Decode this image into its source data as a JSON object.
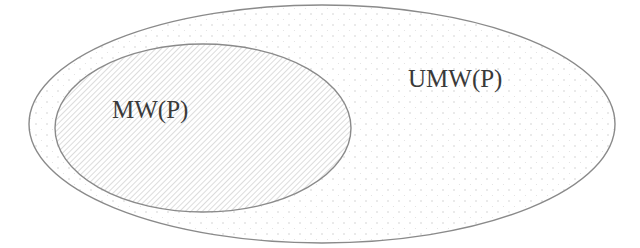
{
  "diagram": {
    "type": "euler-nested-sets",
    "colors": {
      "background": "#ffffff",
      "outline": "#8a8a8a",
      "label": "#3a3a3a",
      "outer_dots": "#cfcfcf",
      "inner_hatch": "#d6d6d6"
    },
    "outer_set": {
      "label": "UMW(P)",
      "fill_pattern": "dots"
    },
    "inner_set": {
      "label": "MW(P)",
      "fill_pattern": "diagonal-hatch"
    }
  }
}
